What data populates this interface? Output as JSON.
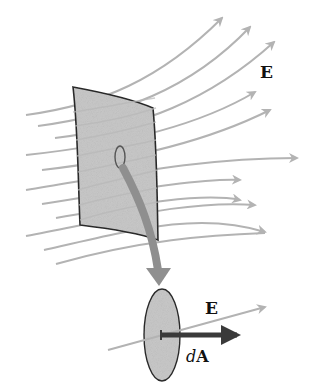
{
  "diagram": {
    "type": "electric-flux-through-surface",
    "labels": {
      "field_top": "E",
      "field_bottom": "E",
      "area_d": "d",
      "area_A": "A"
    },
    "colors": {
      "field_line": "#b3b3b3",
      "surface_fill": "#c8c8c8",
      "surface_stroke": "#2a2a2a",
      "magnify_arrow": "#8f8f8f",
      "area_vector": "#3a3a3a",
      "background": "#ffffff"
    }
  }
}
